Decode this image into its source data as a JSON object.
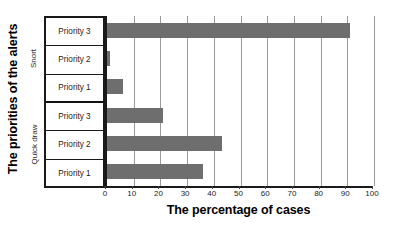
{
  "chart_data": {
    "type": "bar",
    "orientation": "horizontal",
    "title": "",
    "xlabel": "The percentage of cases",
    "ylabel": "The priorities of the alerts",
    "xlim": [
      0,
      100
    ],
    "xticks": [
      0,
      10,
      20,
      30,
      40,
      50,
      60,
      70,
      80,
      90,
      100
    ],
    "grid": true,
    "legend": false,
    "bar_color": "#6e6e6e",
    "groups": [
      {
        "name": "Snort",
        "categories": [
          "Priority 3",
          "Priority 2",
          "Priority 1"
        ],
        "values": [
          91,
          1,
          6
        ]
      },
      {
        "name": "Quick draw",
        "categories": [
          "Priority 3",
          "Priority 2",
          "Priority 1"
        ],
        "values": [
          21,
          43,
          36
        ]
      }
    ],
    "categories": [
      "Snort / Priority 3",
      "Snort / Priority 2",
      "Snort / Priority 1",
      "Quick draw / Priority 3",
      "Quick draw / Priority 2",
      "Quick draw / Priority 1"
    ],
    "values": [
      91,
      1,
      6,
      21,
      43,
      36
    ]
  },
  "axes": {
    "y_title": "The priorities of the alerts",
    "x_title": "The percentage of cases",
    "x_tick_labels": [
      "0",
      "10",
      "20",
      "30",
      "40",
      "50",
      "60",
      "70",
      "80",
      "90",
      "100"
    ]
  },
  "group_labels": {
    "snort": "Snort",
    "quickdraw": "Quick draw"
  },
  "rows": [
    {
      "label": "Priority 3",
      "value": 91,
      "group": "Snort"
    },
    {
      "label": "Priority 2",
      "value": 1,
      "group": "Snort"
    },
    {
      "label": "Priority 1",
      "value": 6,
      "group": "Snort"
    },
    {
      "label": "Priority 3",
      "value": 21,
      "group": "Quick draw"
    },
    {
      "label": "Priority 2",
      "value": 43,
      "group": "Quick draw"
    },
    {
      "label": "Priority 1",
      "value": 36,
      "group": "Quick draw"
    }
  ]
}
